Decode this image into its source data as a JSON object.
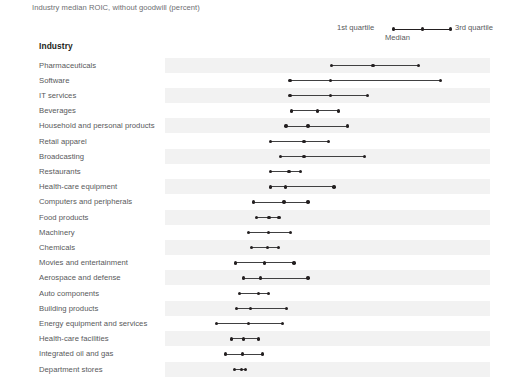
{
  "chart": {
    "title": "Industry median ROIC, without goodwill (percent)",
    "column_header": "Industry",
    "legend": {
      "q1_label": "1st quartile",
      "median_label": "Median",
      "q3_label": "3rd quartile"
    }
  },
  "chart_data": {
    "type": "range-dot-plot",
    "title": "Industry median ROIC, without goodwill (percent)",
    "xlabel": "",
    "ylabel": "Industry",
    "grid": false,
    "legend_position": "top-right",
    "legend_entries": [
      "1st quartile",
      "Median",
      "3rd quartile"
    ],
    "series": [
      {
        "name": "1st quartile"
      },
      {
        "name": "Median"
      },
      {
        "name": "3rd quartile"
      }
    ],
    "xlim": [
      0,
      60
    ],
    "categories": [
      "Pharmaceuticals",
      "Software",
      "IT services",
      "Beverages",
      "Household and personal products",
      "Retail apparel",
      "Broadcasting",
      "Restaurants",
      "Health-care equipment",
      "Computers and peripherals",
      "Food products",
      "Machinery",
      "Chemicals",
      "Movies and entertainment",
      "Aerospace and defense",
      "Auto components",
      "Building products",
      "Energy equipment and services",
      "Health-care facilities",
      "Integrated oil and gas",
      "Department stores"
    ],
    "rows": [
      {
        "label": "Pharmaceuticals",
        "q1": 26.7,
        "median": 34.5,
        "q3": 43.1
      },
      {
        "label": "Software",
        "q1": 18.9,
        "median": 26.5,
        "q3": 47.3
      },
      {
        "label": "IT services",
        "q1": 18.9,
        "median": 26.5,
        "q3": 33.5
      },
      {
        "label": "Beverages",
        "q1": 19.1,
        "median": 24.0,
        "q3": 28.0
      },
      {
        "label": "Household and personal products",
        "q1": 18.1,
        "median": 22.3,
        "q3": 29.7
      },
      {
        "label": "Retail apparel",
        "q1": 15.2,
        "median": 21.5,
        "q3": 26.1
      },
      {
        "label": "Broadcasting",
        "q1": 17.1,
        "median": 21.5,
        "q3": 32.9
      },
      {
        "label": "Restaurants",
        "q1": 15.2,
        "median": 18.7,
        "q3": 20.8
      },
      {
        "label": "Health-care equipment",
        "q1": 15.2,
        "median": 18.0,
        "q3": 27.2
      },
      {
        "label": "Computers and peripherals",
        "q1": 12.0,
        "median": 17.7,
        "q3": 22.3
      },
      {
        "label": "Food products",
        "q1": 12.6,
        "median": 14.9,
        "q3": 16.8
      },
      {
        "label": "Machinery",
        "q1": 11.0,
        "median": 14.8,
        "q3": 19.0
      },
      {
        "label": "Chemicals",
        "q1": 11.6,
        "median": 14.6,
        "q3": 16.7
      },
      {
        "label": "Movies and entertainment",
        "q1": 8.6,
        "median": 14.1,
        "q3": 19.6
      },
      {
        "label": "Aerospace and defense",
        "q1": 10.1,
        "median": 13.3,
        "q3": 22.3
      },
      {
        "label": "Auto components",
        "q1": 9.3,
        "median": 12.9,
        "q3": 14.8
      },
      {
        "label": "Building products",
        "q1": 8.8,
        "median": 11.4,
        "q3": 18.2
      },
      {
        "label": "Energy equipment and services",
        "q1": 5.0,
        "median": 11.0,
        "q3": 17.5
      },
      {
        "label": "Health-care facilities",
        "q1": 7.8,
        "median": 10.1,
        "q3": 12.9
      },
      {
        "label": "Integrated oil and gas",
        "q1": 6.7,
        "median": 9.9,
        "q3": 13.7
      },
      {
        "label": "Department stores",
        "q1": 8.4,
        "median": 9.7,
        "q3": 10.5
      }
    ]
  },
  "scale": {
    "x_zero_px": 190,
    "px_per_unit": 5.3,
    "row_top_px": 57.5,
    "row_height_px": 15.2,
    "band_left_px": 165,
    "band_width_px": 325
  },
  "colors": {
    "dot": "#231f20",
    "line": "#404041",
    "band": "#f2f2f2",
    "label_text": "#58595b",
    "header_text": "#231f20",
    "title_text": "#6d6e71",
    "background": "#ffffff"
  }
}
